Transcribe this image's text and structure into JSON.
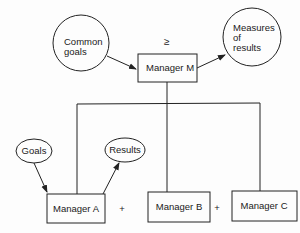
{
  "diagram": {
    "nodes": {
      "common_goals": {
        "lines": [
          "Common",
          "goals"
        ],
        "shape": "circle"
      },
      "manager_m": {
        "label": "Manager M",
        "shape": "box"
      },
      "measures_of_results": {
        "lines": [
          "Measures",
          "of",
          "results"
        ],
        "shape": "circle"
      },
      "goals": {
        "label": "Goals",
        "shape": "ellipse"
      },
      "results": {
        "label": "Results",
        "shape": "ellipse"
      },
      "manager_a": {
        "label": "Manager A",
        "shape": "box"
      },
      "manager_b": {
        "label": "Manager B",
        "shape": "box"
      },
      "manager_c": {
        "label": "Manager C",
        "shape": "box"
      }
    },
    "symbols": {
      "greater_equal": "≥",
      "plus_1": "+",
      "plus_2": "+"
    },
    "edges": [
      {
        "from": "common_goals",
        "to": "manager_m",
        "type": "arrow"
      },
      {
        "from": "manager_m",
        "to": "measures_of_results",
        "type": "arrow"
      },
      {
        "from": "manager_m",
        "to": "manager_a",
        "type": "line"
      },
      {
        "from": "manager_m",
        "to": "manager_b",
        "type": "line"
      },
      {
        "from": "manager_m",
        "to": "manager_c",
        "type": "line"
      },
      {
        "from": "goals",
        "to": "manager_a",
        "type": "arrow"
      },
      {
        "from": "manager_a",
        "to": "results",
        "type": "arrow"
      }
    ]
  }
}
